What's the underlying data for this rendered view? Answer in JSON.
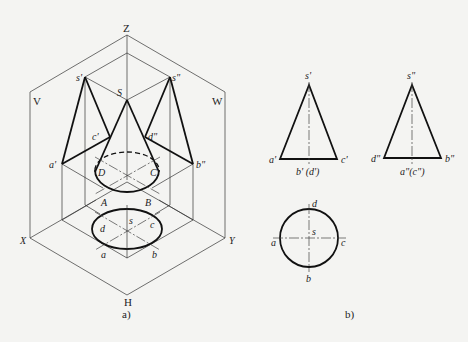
{
  "figure_a": {
    "caption": "a)",
    "axes": {
      "z": "Z",
      "x": "X",
      "y": "Y"
    },
    "planes": {
      "v": "V",
      "w": "W",
      "h": "H"
    },
    "points": {
      "S": "S",
      "s_v": "s'",
      "s_w": "s\"",
      "a_v": "a'",
      "c_v": "c'",
      "d_w": "d\"",
      "b_w": "b\"",
      "A": "A",
      "B": "B",
      "C": "C",
      "D": "D",
      "s_h": "s",
      "a_h": "a",
      "b_h": "b",
      "c_h": "c",
      "d_h": "d"
    }
  },
  "figure_b": {
    "caption": "b)",
    "front_view": {
      "apex": "s'",
      "left": "a'",
      "right": "c'",
      "bottom": "b' (d')"
    },
    "side_view": {
      "apex": "s\"",
      "left": "d\"",
      "right": "b\"",
      "bottom": "a\"(c\")"
    },
    "top_view": {
      "center": "s",
      "top": "d",
      "bottom": "b",
      "left": "a",
      "right": "c"
    }
  }
}
